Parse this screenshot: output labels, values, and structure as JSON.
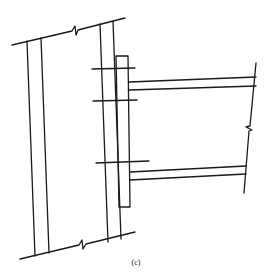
{
  "figure": {
    "caption": "(c)",
    "stroke_color": "#1a1a1a",
    "background": "#ffffff"
  },
  "elements": {
    "column": {
      "top_break_line": [
        [
          12,
          45
        ],
        [
          72,
          31
        ],
        [
          75,
          26
        ],
        [
          76,
          35
        ],
        [
          78,
          30
        ],
        [
          125,
          18
        ]
      ],
      "bottom_break_line": [
        [
          20,
          259
        ],
        [
          79,
          245
        ],
        [
          82,
          240
        ],
        [
          83,
          249
        ],
        [
          86,
          244
        ],
        [
          135,
          232
        ]
      ],
      "flange_lines": [
        [
          [
            27,
            41
          ],
          [
            35,
            256
          ]
        ],
        [
          [
            41,
            38
          ],
          [
            49,
            253
          ]
        ],
        [
          [
            100,
            24
          ],
          [
            108,
            242
          ]
        ],
        [
          [
            113,
            21
          ],
          [
            121,
            239
          ]
        ]
      ]
    },
    "end_plate": {
      "points": [
        [
          116,
          56
        ],
        [
          128,
          56
        ],
        [
          130,
          207
        ],
        [
          119,
          207
        ],
        [
          116,
          56
        ]
      ]
    },
    "bolts": [
      [
        [
          92,
          69
        ],
        [
          135,
          68
        ]
      ],
      [
        [
          93,
          101
        ],
        [
          137,
          100
        ]
      ],
      [
        [
          96,
          163
        ],
        [
          149,
          161
        ]
      ]
    ],
    "beam": {
      "top_flange": [
        [
          [
            129,
            82
          ],
          [
            256,
            77
          ]
        ],
        [
          [
            129,
            90
          ],
          [
            256,
            86
          ]
        ]
      ],
      "bottom_flange": [
        [
          [
            130,
            172
          ],
          [
            246,
            166
          ]
        ],
        [
          [
            130,
            180
          ],
          [
            246,
            174
          ]
        ]
      ],
      "end_break_line": [
        [
          256,
          63
        ],
        [
          250,
          126
        ],
        [
          246,
          127
        ],
        [
          252,
          130
        ],
        [
          249,
          131
        ],
        [
          244,
          193
        ]
      ]
    }
  }
}
